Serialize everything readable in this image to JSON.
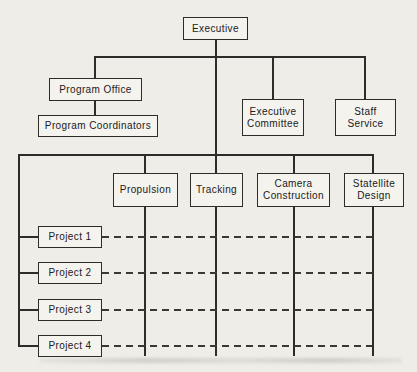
{
  "chart": {
    "kind": "matrix-organization-chart",
    "nodes": {
      "executive": {
        "label": "Executive"
      },
      "program_office": {
        "label": "Program Office"
      },
      "program_coordinators": {
        "label": "Program Coordinators"
      },
      "executive_committee": {
        "label": "Executive Committee"
      },
      "staff_service": {
        "label": "Staff Service"
      },
      "propulsion": {
        "label": "Propulsion"
      },
      "tracking": {
        "label": "Tracking"
      },
      "camera_construction": {
        "label": "Camera Construction"
      },
      "satellite_design": {
        "label": "Statellite Design"
      },
      "project_1": {
        "label": "Project 1"
      },
      "project_2": {
        "label": "Project 2"
      },
      "project_3": {
        "label": "Project 3"
      },
      "project_4": {
        "label": "Project 4"
      }
    },
    "solid_edges": [
      [
        "Executive",
        "Program Office"
      ],
      [
        "Executive",
        "Executive Committee"
      ],
      [
        "Executive",
        "Staff Service"
      ],
      [
        "Program Office",
        "Program Coordinators"
      ],
      [
        "Executive",
        "Propulsion"
      ],
      [
        "Executive",
        "Tracking"
      ],
      [
        "Executive",
        "Camera Construction"
      ],
      [
        "Executive",
        "Statellite Design"
      ],
      [
        "Executive",
        "Project 1"
      ],
      [
        "Executive",
        "Project 2"
      ],
      [
        "Executive",
        "Project 3"
      ],
      [
        "Executive",
        "Project 4"
      ]
    ],
    "dashed_rows": [
      [
        "Project 1",
        "Propulsion",
        "Tracking",
        "Camera Construction",
        "Statellite Design"
      ],
      [
        "Project 2",
        "Propulsion",
        "Tracking",
        "Camera Construction",
        "Statellite Design"
      ],
      [
        "Project 3",
        "Propulsion",
        "Tracking",
        "Camera Construction",
        "Statellite Design"
      ],
      [
        "Project 4",
        "Propulsion",
        "Tracking",
        "Camera Construction",
        "Statellite Design"
      ]
    ],
    "colors": {
      "background": "#efede7",
      "line": "#2e2c28",
      "box_fill": "#f4f3ee",
      "text": "#21201c"
    }
  }
}
